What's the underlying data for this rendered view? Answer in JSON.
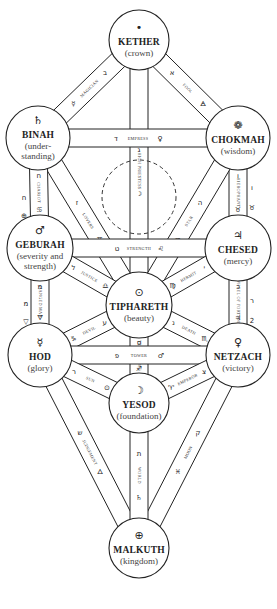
{
  "diagram": {
    "sephiroth": [
      {
        "id": "kether",
        "name": "KETHER",
        "subtitle": [
          "(crown)"
        ],
        "symbol": "•",
        "x": 139,
        "y": 40,
        "r": 30
      },
      {
        "id": "chokmah",
        "name": "CHOKMAH",
        "subtitle": [
          "(wisdom)"
        ],
        "symbol": "❁",
        "x": 238,
        "y": 138,
        "r": 32
      },
      {
        "id": "binah",
        "name": "BINAH",
        "subtitle": [
          "(under-",
          "standing)"
        ],
        "symbol": "♄",
        "x": 38,
        "y": 138,
        "r": 32
      },
      {
        "id": "chesed",
        "name": "CHESED",
        "subtitle": [
          "(mercy)"
        ],
        "symbol": "♃",
        "x": 238,
        "y": 248,
        "r": 33
      },
      {
        "id": "geburah",
        "name": "GEBURAH",
        "subtitle": [
          "(severity and",
          "strength)"
        ],
        "symbol": "♂",
        "x": 40,
        "y": 248,
        "r": 33
      },
      {
        "id": "tiphareth",
        "name": "TIPHARETH",
        "subtitle": [
          "(beauty)"
        ],
        "symbol": "⊙",
        "x": 139,
        "y": 305,
        "r": 33
      },
      {
        "id": "netzach",
        "name": "NETZACH",
        "subtitle": [
          "(victory)"
        ],
        "symbol": "♀",
        "x": 238,
        "y": 355,
        "r": 32
      },
      {
        "id": "hod",
        "name": "HOD",
        "subtitle": [
          "(glory)"
        ],
        "symbol": "☿",
        "x": 40,
        "y": 355,
        "r": 32
      },
      {
        "id": "yesod",
        "name": "YESOD",
        "subtitle": [
          "(foundation)"
        ],
        "symbol": "☽",
        "x": 139,
        "y": 403,
        "r": 30
      },
      {
        "id": "malkuth",
        "name": "MALKUTH",
        "subtitle": [
          "(kingdom)"
        ],
        "symbol": "⊕",
        "x": 139,
        "y": 548,
        "r": 30
      }
    ],
    "paths": [
      {
        "card": "FOOL",
        "from": "kether",
        "to": "chokmah",
        "letter": "א",
        "sign": "🜁"
      },
      {
        "card": "MAGICIAN",
        "from": "kether",
        "to": "binah",
        "letter": "ב",
        "sign": "☿"
      },
      {
        "card": "HIGH PRIESTESS",
        "from": "kether",
        "to": "tiphareth",
        "letter": "ג",
        "sign": "☽"
      },
      {
        "card": "EMPRESS",
        "from": "binah",
        "to": "chokmah",
        "letter": "ד",
        "sign": "♀"
      },
      {
        "card": "HIEROPHANT",
        "from": "chokmah",
        "to": "chesed",
        "letter": "ו",
        "sign": "♉"
      },
      {
        "card": "STAR",
        "from": "chokmah",
        "to": "tiphareth",
        "letter": "ה",
        "sign": "♒"
      },
      {
        "card": "LOVERS",
        "from": "binah",
        "to": "tiphareth",
        "letter": "ז",
        "sign": "♊"
      },
      {
        "card": "CHARIOT",
        "from": "binah",
        "to": "geburah",
        "letter": "ח",
        "sign": "♋"
      },
      {
        "card": "STRENGTH",
        "from": "geburah",
        "to": "chesed",
        "letter": "ט",
        "sign": "♌"
      },
      {
        "card": "HERMIT",
        "from": "chesed",
        "to": "tiphareth",
        "letter": "י",
        "sign": "♍"
      },
      {
        "card": "WHEEL OF FORTUNE",
        "from": "chesed",
        "to": "netzach",
        "letter": "כ",
        "sign": "♃"
      },
      {
        "card": "JUSTICE",
        "from": "geburah",
        "to": "tiphareth",
        "letter": "ל",
        "sign": "♎"
      },
      {
        "card": "HANGED MAN",
        "from": "geburah",
        "to": "hod",
        "letter": "מ",
        "sign": "🜄"
      },
      {
        "card": "DEATH",
        "from": "tiphareth",
        "to": "netzach",
        "letter": "נ",
        "sign": "♏"
      },
      {
        "card": "TEMPERANCE",
        "from": "tiphareth",
        "to": "yesod",
        "letter": "ס",
        "sign": "♐"
      },
      {
        "card": "DEVIL",
        "from": "tiphareth",
        "to": "hod",
        "letter": "ע",
        "sign": "♑"
      },
      {
        "card": "TOWER",
        "from": "hod",
        "to": "netzach",
        "letter": "פ",
        "sign": "♂"
      },
      {
        "card": "EMPEROR",
        "from": "netzach",
        "to": "yesod",
        "letter": "צ",
        "sign": "♈"
      },
      {
        "card": "MOON",
        "from": "netzach",
        "to": "malkuth",
        "letter": "ק",
        "sign": "♓"
      },
      {
        "card": "SUN",
        "from": "hod",
        "to": "yesod",
        "letter": "ר",
        "sign": "⊙"
      },
      {
        "card": "JUDGEMENT",
        "from": "hod",
        "to": "malkuth",
        "letter": "ש",
        "sign": "🜂"
      },
      {
        "card": "WORLD",
        "from": "yesod",
        "to": "malkuth",
        "letter": "ת",
        "sign": "♄"
      }
    ],
    "outside_labels": [
      {
        "text": "ח",
        "x": 24,
        "y": 200
      },
      {
        "text": "⊕",
        "x": 24,
        "y": 218
      },
      {
        "text": "ו",
        "x": 252,
        "y": 190
      },
      {
        "text": "♉",
        "x": 252,
        "y": 210
      },
      {
        "text": "מ",
        "x": 26,
        "y": 306
      },
      {
        "text": "▽",
        "x": 26,
        "y": 324
      },
      {
        "text": "ר",
        "x": 252,
        "y": 303
      },
      {
        "text": "2",
        "x": 252,
        "y": 323
      }
    ]
  }
}
